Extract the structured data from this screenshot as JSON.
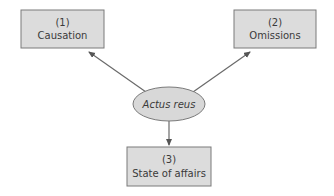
{
  "diagram": {
    "center": {
      "label": "Actus reus"
    },
    "nodes": [
      {
        "number": "(1)",
        "label": "Causation"
      },
      {
        "number": "(2)",
        "label": "Omissions"
      },
      {
        "number": "(3)",
        "label": "State of affairs"
      }
    ],
    "edges": [
      {
        "from": "Actus reus",
        "to": "Causation"
      },
      {
        "from": "Actus reus",
        "to": "Omissions"
      },
      {
        "from": "Actus reus",
        "to": "State of affairs"
      }
    ],
    "colors": {
      "box_fill": "#dcdcdc",
      "box_stroke": "#7a7a7a",
      "ellipse_fill": "#d8d8d8",
      "arrow": "#6a6a6a",
      "text": "#3a3a3a"
    }
  }
}
